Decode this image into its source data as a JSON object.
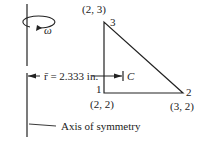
{
  "diagram": {
    "omega_label": "ω",
    "radius_label": "r̄ = 2.333 in.",
    "centroid_label": "C",
    "axis_label": "Axis of symmetry",
    "nodes": [
      {
        "id": "1",
        "coord": "(2, 2)"
      },
      {
        "id": "2",
        "coord": "(3, 2)"
      },
      {
        "id": "3",
        "coord": "(2, 3)"
      }
    ]
  }
}
